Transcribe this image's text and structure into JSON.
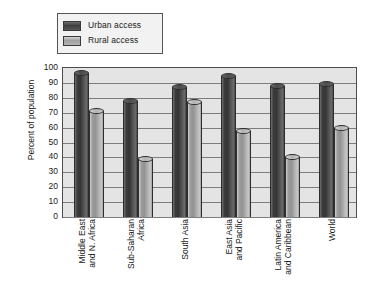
{
  "chart_data": {
    "type": "bar",
    "title": "",
    "xlabel": "",
    "ylabel": "Percent of population",
    "ylim": [
      0,
      100
    ],
    "ytick_step": 10,
    "yticks": [
      "100",
      "90",
      "80",
      "70",
      "60",
      "50",
      "40",
      "30",
      "20",
      "10",
      "0"
    ],
    "grid": true,
    "legend_position": "top-left",
    "categories": [
      "Middle East and N. Africa",
      "Sub-Saharan Africa",
      "South Asia",
      "East Asia and Pacific",
      "Latin America and Caribbean",
      "World"
    ],
    "category_lines": [
      [
        "Middle East",
        "and N. Africa"
      ],
      [
        "Sub-Saharan",
        "Africa"
      ],
      [
        "South Asia"
      ],
      [
        "East Asia",
        "and Pacific"
      ],
      [
        "Latin America",
        "and Caribbean"
      ],
      [
        "World"
      ]
    ],
    "series": [
      {
        "name": "Urban access",
        "color": "#4a4a4a",
        "values": [
          97,
          78,
          87,
          95,
          88,
          89
        ]
      },
      {
        "name": "Rural access",
        "color": "#a8a8a8",
        "values": [
          71,
          39,
          77,
          58,
          40,
          60
        ]
      }
    ]
  },
  "legend": {
    "items": [
      {
        "label": "Urban access",
        "swatch": "urban"
      },
      {
        "label": "Rural access",
        "swatch": "rural"
      }
    ]
  },
  "colors": {
    "urban": "#4a4a4a",
    "rural": "#a8a8a8",
    "plot_background": "#e4e4e4",
    "gridline": "#7d7d7d",
    "axis": "#4d4d4d",
    "page_background": "#ffffff"
  }
}
